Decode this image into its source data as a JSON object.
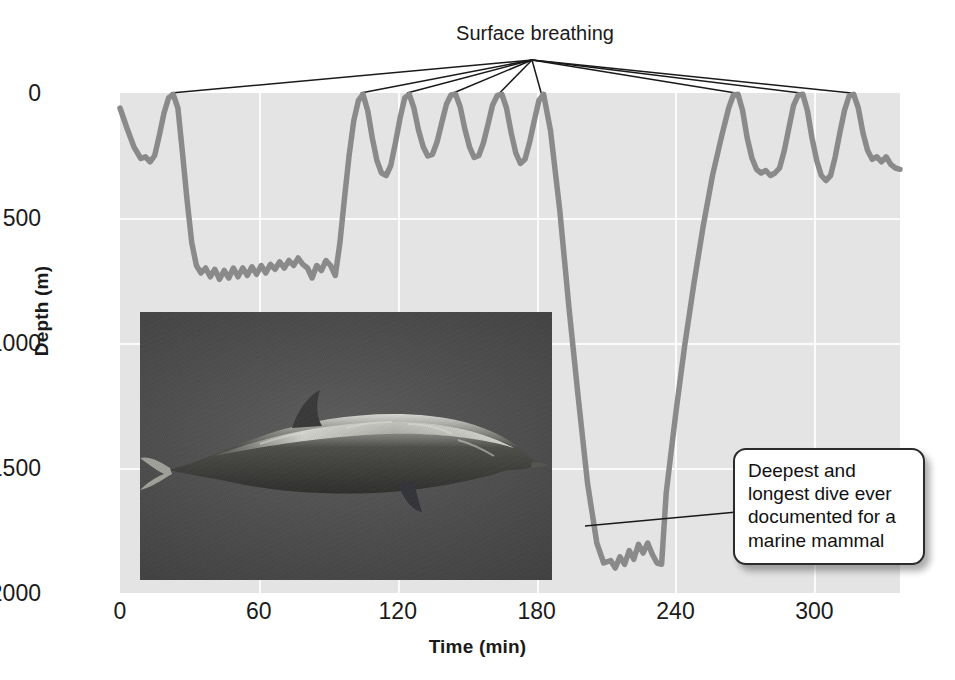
{
  "chart_data": {
    "type": "line",
    "title": "",
    "xlabel": "Time (min)",
    "ylabel": "Depth (m)",
    "xlim": [
      0,
      337
    ],
    "ylim": [
      2000,
      0
    ],
    "y_inverted": true,
    "grid": true,
    "legend": null,
    "xticks": [
      0,
      60,
      120,
      180,
      240,
      300
    ],
    "yticks": [
      0,
      500,
      1000,
      1500,
      2000
    ],
    "series": [
      {
        "name": "Dive depth profile",
        "color": "#8a8a8a",
        "points": [
          [
            0,
            60
          ],
          [
            3,
            140
          ],
          [
            6,
            215
          ],
          [
            9,
            262
          ],
          [
            11,
            255
          ],
          [
            13,
            275
          ],
          [
            15,
            250
          ],
          [
            17,
            170
          ],
          [
            19,
            80
          ],
          [
            21,
            20
          ],
          [
            23,
            5
          ],
          [
            25,
            60
          ],
          [
            27,
            240
          ],
          [
            29,
            430
          ],
          [
            31,
            600
          ],
          [
            33,
            690
          ],
          [
            35,
            720
          ],
          [
            37,
            700
          ],
          [
            39,
            735
          ],
          [
            41,
            705
          ],
          [
            43,
            745
          ],
          [
            45,
            710
          ],
          [
            47,
            740
          ],
          [
            49,
            700
          ],
          [
            51,
            735
          ],
          [
            53,
            700
          ],
          [
            55,
            730
          ],
          [
            57,
            695
          ],
          [
            59,
            725
          ],
          [
            61,
            690
          ],
          [
            63,
            720
          ],
          [
            65,
            685
          ],
          [
            67,
            705
          ],
          [
            69,
            675
          ],
          [
            71,
            700
          ],
          [
            73,
            670
          ],
          [
            75,
            690
          ],
          [
            77,
            660
          ],
          [
            79,
            685
          ],
          [
            81,
            700
          ],
          [
            83,
            740
          ],
          [
            85,
            690
          ],
          [
            87,
            710
          ],
          [
            89,
            670
          ],
          [
            91,
            690
          ],
          [
            93,
            730
          ],
          [
            95,
            600
          ],
          [
            97,
            420
          ],
          [
            99,
            250
          ],
          [
            101,
            110
          ],
          [
            103,
            30
          ],
          [
            105,
            5
          ],
          [
            107,
            70
          ],
          [
            109,
            180
          ],
          [
            111,
            270
          ],
          [
            113,
            320
          ],
          [
            115,
            330
          ],
          [
            117,
            290
          ],
          [
            119,
            200
          ],
          [
            121,
            100
          ],
          [
            123,
            20
          ],
          [
            125,
            5
          ],
          [
            127,
            60
          ],
          [
            129,
            150
          ],
          [
            131,
            215
          ],
          [
            133,
            252
          ],
          [
            135,
            245
          ],
          [
            137,
            195
          ],
          [
            139,
            120
          ],
          [
            141,
            45
          ],
          [
            143,
            8
          ],
          [
            145,
            5
          ],
          [
            147,
            55
          ],
          [
            149,
            145
          ],
          [
            151,
            215
          ],
          [
            153,
            258
          ],
          [
            155,
            250
          ],
          [
            157,
            200
          ],
          [
            159,
            125
          ],
          [
            161,
            48
          ],
          [
            163,
            10
          ],
          [
            165,
            5
          ],
          [
            167,
            60
          ],
          [
            169,
            160
          ],
          [
            171,
            240
          ],
          [
            173,
            282
          ],
          [
            175,
            265
          ],
          [
            177,
            195
          ],
          [
            179,
            110
          ],
          [
            181,
            30
          ],
          [
            183,
            5
          ],
          [
            186,
            150
          ],
          [
            190,
            470
          ],
          [
            194,
            860
          ],
          [
            198,
            1220
          ],
          [
            202,
            1560
          ],
          [
            206,
            1800
          ],
          [
            209,
            1880
          ],
          [
            212,
            1870
          ],
          [
            214,
            1900
          ],
          [
            216,
            1855
          ],
          [
            218,
            1885
          ],
          [
            220,
            1830
          ],
          [
            222,
            1865
          ],
          [
            224,
            1805
          ],
          [
            226,
            1840
          ],
          [
            228,
            1800
          ],
          [
            230,
            1845
          ],
          [
            232,
            1880
          ],
          [
            234,
            1885
          ],
          [
            236,
            1600
          ],
          [
            240,
            1290
          ],
          [
            244,
            1010
          ],
          [
            248,
            760
          ],
          [
            252,
            530
          ],
          [
            256,
            330
          ],
          [
            260,
            170
          ],
          [
            263,
            60
          ],
          [
            265,
            8
          ],
          [
            267,
            5
          ],
          [
            269,
            70
          ],
          [
            271,
            180
          ],
          [
            273,
            260
          ],
          [
            275,
            305
          ],
          [
            277,
            320
          ],
          [
            279,
            310
          ],
          [
            281,
            330
          ],
          [
            283,
            320
          ],
          [
            285,
            300
          ],
          [
            287,
            230
          ],
          [
            289,
            140
          ],
          [
            291,
            50
          ],
          [
            293,
            8
          ],
          [
            295,
            5
          ],
          [
            297,
            70
          ],
          [
            299,
            180
          ],
          [
            301,
            270
          ],
          [
            303,
            330
          ],
          [
            305,
            350
          ],
          [
            307,
            330
          ],
          [
            309,
            255
          ],
          [
            311,
            160
          ],
          [
            313,
            70
          ],
          [
            315,
            12
          ],
          [
            317,
            5
          ],
          [
            319,
            60
          ],
          [
            321,
            160
          ],
          [
            323,
            230
          ],
          [
            325,
            265
          ],
          [
            327,
            255
          ],
          [
            329,
            275
          ],
          [
            331,
            255
          ],
          [
            333,
            285
          ],
          [
            335,
            300
          ],
          [
            337,
            305
          ]
        ]
      }
    ],
    "annotations": [
      {
        "id": "surface-breathing",
        "text": "Surface breathing",
        "anchor_x": 180,
        "anchor_y": 0,
        "leader_targets_min": [
          22,
          104,
          124,
          144,
          164,
          182,
          266,
          294,
          316
        ]
      },
      {
        "id": "deepest-dive",
        "text": "Deepest and longest dive ever documented for a marine mammal",
        "lines": [
          "Deepest and",
          "longest dive ever",
          "documented for a",
          "marine mammal"
        ],
        "points_to_min": 205,
        "points_to_depth": 1830
      }
    ],
    "inset_photo": {
      "name": "cuviers-beaked-whale-photo",
      "description": "Underwater photograph of a beaked whale swimming"
    }
  },
  "axes": {
    "y_title": "Depth (m)",
    "x_title": "Time (min)",
    "y_ticks": [
      "0",
      "500",
      "1000",
      "1500",
      "2000"
    ],
    "x_ticks": [
      "0",
      "60",
      "120",
      "180",
      "240",
      "300"
    ]
  },
  "labels": {
    "surface_breathing": "Surface breathing"
  },
  "callout": {
    "line1": "Deepest and",
    "line2": "longest dive ever",
    "line3": "documented for a",
    "line4": "marine mammal"
  },
  "colors": {
    "plot_background": "#e4e4e4",
    "gridline": "#fbfbfb",
    "trace": "#8a8a8a",
    "leader_line": "#1a1a1a",
    "text": "#1a1a1a",
    "callout_border": "#2b2b2b",
    "callout_background": "#ffffff"
  }
}
